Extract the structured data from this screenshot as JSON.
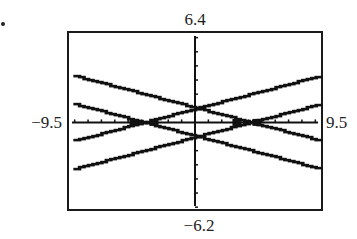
{
  "chart_data": {
    "type": "line",
    "title": "",
    "xlabel": "",
    "ylabel": "",
    "window": {
      "xmin": -9.5,
      "xmax": 9.5,
      "ymin": -6.2,
      "ymax": 6.4,
      "xscale": 1,
      "yscale": 1
    },
    "labels": {
      "top": "6.4",
      "bottom": "−6.2",
      "left": "−9.5",
      "right": "9.5"
    },
    "series": [
      {
        "name": "y = 0.25x + 1",
        "slope": 0.25,
        "intercept": 1
      },
      {
        "name": "y = -0.25x + 1",
        "slope": -0.25,
        "intercept": 1
      },
      {
        "name": "y = -0.25x - 1",
        "slope": -0.25,
        "intercept": -1
      },
      {
        "name": "y = 0.25x - 1",
        "slope": 0.25,
        "intercept": -1
      }
    ],
    "x_range_plotted": [
      -9.1,
      9.2
    ],
    "grid": false,
    "legend": null,
    "style": "graphing-calculator stepped pixels"
  },
  "frame": {
    "left": 68,
    "top": 32,
    "right": 322,
    "bottom": 210
  }
}
